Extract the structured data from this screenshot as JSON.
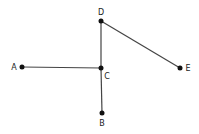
{
  "diagram": {
    "type": "graph",
    "colors": {
      "edge": "#444444",
      "node": "#111111",
      "label": "#222222"
    },
    "nodes": [
      {
        "id": "A",
        "label": "A",
        "x": 22,
        "y": 67,
        "lx": 14,
        "ly": 70
      },
      {
        "id": "B",
        "label": "B",
        "x": 102,
        "y": 113,
        "lx": 102,
        "ly": 126
      },
      {
        "id": "C",
        "label": "C",
        "x": 101,
        "y": 68,
        "lx": 107,
        "ly": 79
      },
      {
        "id": "D",
        "label": "D",
        "x": 101,
        "y": 21,
        "lx": 101,
        "ly": 15
      },
      {
        "id": "E",
        "label": "E",
        "x": 180,
        "y": 68,
        "lx": 188,
        "ly": 71
      }
    ],
    "edges": [
      {
        "from": "A",
        "to": "C"
      },
      {
        "from": "C",
        "to": "B"
      },
      {
        "from": "C",
        "to": "D"
      },
      {
        "from": "D",
        "to": "E"
      }
    ]
  }
}
